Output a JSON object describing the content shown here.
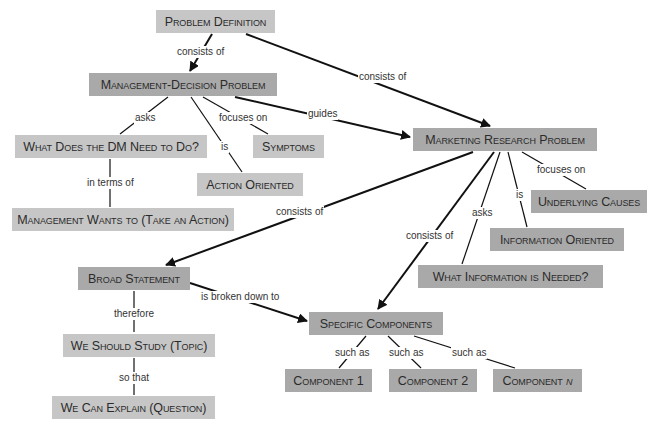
{
  "diagram": {
    "type": "concept-map",
    "colors": {
      "light_node": "#c6c6c6",
      "dark_node": "#a9a9a9",
      "line": "#111111",
      "text": "#2b2b2b"
    },
    "nodes": {
      "problem_definition": "Problem Definition",
      "management_decision_problem": "Management-Decision Problem",
      "what_does_dm_need": "What Does the DM Need to Do?",
      "symptoms": "Symptoms",
      "action_oriented": "Action Oriented",
      "management_wants_to": "Management Wants to (Take an Action)",
      "marketing_research_problem": "Marketing Research Problem",
      "underlying_causes": "Underlying Causes",
      "information_oriented": "Information Oriented",
      "what_information_needed": "What Information is Needed?",
      "broad_statement": "Broad Statement",
      "specific_components": "Specific Components",
      "we_should_study": "We Should Study (Topic)",
      "we_can_explain": "We Can Explain (Question)",
      "component_1": "Component 1",
      "component_2": "Component 2",
      "component_n_prefix": "Component ",
      "component_n_var": "n"
    },
    "links": {
      "pd_to_mdp": "consists of",
      "pd_to_mrp": "consists of",
      "mdp_asks": "asks",
      "mdp_focuses": "focuses on",
      "mdp_is": "is",
      "mdp_guides": "guides",
      "dm_in_terms": "in terms of",
      "mrp_consists_broad": "consists of",
      "mrp_consists_specific": "consists of",
      "mrp_asks": "asks",
      "mrp_is": "is",
      "mrp_focuses": "focuses on",
      "broad_broken": "is broken down to",
      "broad_therefore": "therefore",
      "study_so_that": "so that",
      "such_as_1": "such as",
      "such_as_2": "such as",
      "such_as_n": "such as"
    }
  }
}
